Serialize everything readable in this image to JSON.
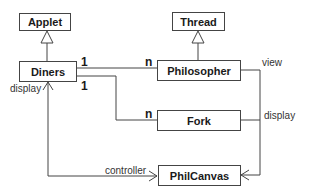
{
  "diagram": {
    "type": "uml-class-diagram",
    "classes": {
      "applet": "Applet",
      "thread": "Thread",
      "diners": "Diners",
      "philosopher": "Philosopher",
      "fork": "Fork",
      "philcanvas": "PhilCanvas"
    },
    "relations": [
      {
        "from": "Diners",
        "to": "Applet",
        "kind": "inheritance"
      },
      {
        "from": "Philosopher",
        "to": "Thread",
        "kind": "inheritance"
      },
      {
        "from": "Diners",
        "to": "Philosopher",
        "kind": "association",
        "from_mult": "1",
        "to_mult": "n"
      },
      {
        "from": "Diners",
        "to": "Fork",
        "kind": "association",
        "from_mult": "1",
        "to_mult": "n"
      },
      {
        "from": "Philosopher",
        "to": "PhilCanvas",
        "kind": "navigable",
        "label": "view"
      },
      {
        "from": "Fork",
        "to": "PhilCanvas",
        "kind": "navigable",
        "label": "display"
      },
      {
        "from": "PhilCanvas",
        "to": "Diners",
        "kind": "bidirectional",
        "labels": [
          "controller",
          "display"
        ]
      }
    ],
    "labels": {
      "mult_diners_phil": "1",
      "mult_phil": "n",
      "mult_diners_fork": "1",
      "mult_fork": "n",
      "view": "view",
      "display_right": "display",
      "display_left": "display",
      "controller": "controller"
    }
  }
}
